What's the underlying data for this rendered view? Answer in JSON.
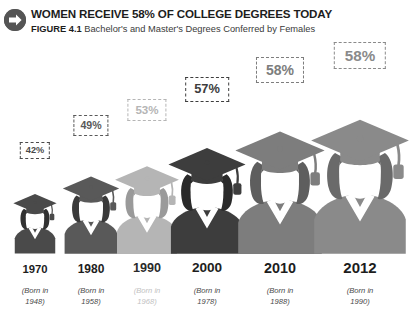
{
  "header": {
    "icon": "arrow-right-circle-icon",
    "title": "WOMEN RECEIVE 58% OF COLLEGE DEGREES TODAY",
    "figure_label": "FIGURE 4.1",
    "subtitle": "Bachelor's and Master's Degrees Conferred by Females"
  },
  "chart_data": {
    "type": "bar",
    "title": "WOMEN RECEIVE 58% OF COLLEGE DEGREES TODAY",
    "subtitle": "Bachelor's and Master's Degrees Conferred by Females",
    "xlabel": "",
    "ylabel": "Percent of degrees conferred to females",
    "ylim": [
      0,
      60
    ],
    "grid": false,
    "legend": "none",
    "categories": [
      "1970",
      "1980",
      "1990",
      "2000",
      "2010",
      "2012"
    ],
    "values": [
      42,
      49,
      53,
      57,
      58,
      58
    ],
    "value_labels": [
      "42%",
      "49%",
      "53%",
      "57%",
      "58%",
      "58%"
    ],
    "annotations": [
      "Born in 1948",
      "Born in 1958",
      "Born in 1968",
      "Born in 1978",
      "Born in 1988",
      "Born in 1990"
    ]
  },
  "columns": [
    {
      "year": "1970",
      "born": "(Born in",
      "born_year": "1948)",
      "percent": "42%",
      "color": "#4a4a4a",
      "hair_color": "#323232",
      "fig_w": 46,
      "fig_h": 66,
      "pct_font": 9.2,
      "pct_pad_x": 5,
      "pct_pad_y": 3,
      "pct_bottom": 152,
      "year_font": 11.3,
      "left": 0
    },
    {
      "year": "1980",
      "born": "(Born in",
      "born_year": "1958)",
      "percent": "49%",
      "color": "#595959",
      "hair_color": "#3a3a3a",
      "fig_w": 60,
      "fig_h": 85,
      "pct_font": 10.6,
      "pct_pad_x": 6,
      "pct_pad_y": 4,
      "pct_bottom": 175,
      "year_font": 12.0,
      "left": 56
    },
    {
      "year": "1990",
      "born": "(Born in",
      "born_year": "1968)",
      "percent": "53%",
      "color": "#b5b5b5",
      "hair_color": "#9a9a9a",
      "fig_w": 68,
      "fig_h": 96,
      "pct_font": 11.6,
      "pct_pad_x": 7,
      "pct_pad_y": 4,
      "pct_bottom": 190,
      "year_font": 12.6,
      "left": 112
    },
    {
      "year": "2000",
      "born": "(Born in",
      "born_year": "1978)",
      "percent": "57%",
      "color": "#3d3d3d",
      "hair_color": "#2a2a2a",
      "fig_w": 82,
      "fig_h": 116,
      "pct_font": 12.8,
      "pct_pad_x": 8,
      "pct_pad_y": 5,
      "pct_bottom": 209,
      "year_font": 13.6,
      "left": 172
    },
    {
      "year": "2010",
      "born": "(Born in",
      "born_year": "1988)",
      "percent": "58%",
      "color": "#7d7d7d",
      "hair_color": "#5e5e5e",
      "fig_w": 95,
      "fig_h": 134,
      "pct_font": 14.0,
      "pct_pad_x": 9,
      "pct_pad_y": 5,
      "pct_bottom": 228,
      "year_font": 14.4,
      "left": 245
    },
    {
      "year": "2012",
      "born": "(Born in",
      "born_year": "1990)",
      "percent": "58%",
      "color": "#8a8a8a",
      "hair_color": "#6a6a6a",
      "fig_w": 104,
      "fig_h": 147,
      "pct_font": 15.2,
      "pct_pad_x": 10,
      "pct_pad_y": 5,
      "pct_bottom": 242,
      "year_font": 15.0,
      "left": 325
    }
  ]
}
